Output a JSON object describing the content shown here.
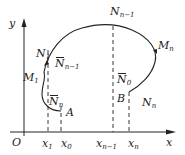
{
  "diagram": {
    "axes": {
      "x_label": "x",
      "y_label": "y",
      "origin_label": "O"
    },
    "points": [
      {
        "id": "N_{n-1}",
        "base": "N",
        "sub": "n−1",
        "bar": false
      },
      {
        "id": "M_n",
        "base": "M",
        "sub": "n",
        "bar": false
      },
      {
        "id": "N_1",
        "base": "N",
        "sub": "1",
        "bar": false
      },
      {
        "id": "barN_{n-1}",
        "base": "N",
        "sub": "n−1",
        "bar": true
      },
      {
        "id": "M_1",
        "base": "M",
        "sub": "1",
        "bar": false
      },
      {
        "id": "barN_n",
        "base": "N",
        "sub": "n",
        "bar": true
      },
      {
        "id": "A",
        "base": "A",
        "sub": "",
        "bar": false
      },
      {
        "id": "barN_0",
        "base": "N",
        "sub": "0",
        "bar": true
      },
      {
        "id": "B",
        "base": "B",
        "sub": "",
        "bar": false
      },
      {
        "id": "N_n",
        "base": "N",
        "sub": "n",
        "bar": false
      }
    ],
    "x_ticks": [
      {
        "base": "x",
        "sub": "1"
      },
      {
        "base": "x",
        "sub": "0"
      },
      {
        "base": "x",
        "sub": "n−1"
      },
      {
        "base": "x",
        "sub": "n"
      }
    ]
  }
}
